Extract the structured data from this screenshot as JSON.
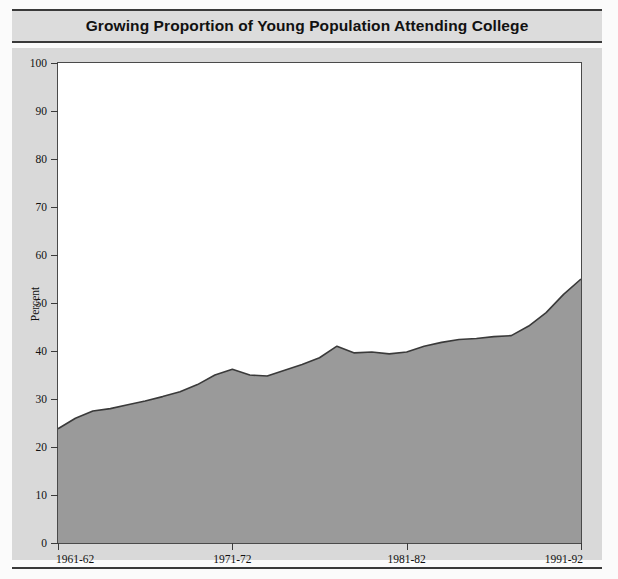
{
  "title": "Growing Proportion of Young Population Attending College",
  "colors": {
    "area_fill": "#9a9a9a",
    "area_line": "#3a3a3a",
    "panel_background": "#d9d9d9",
    "plot_background": "#ffffff",
    "title_band": "#dcdcdc",
    "rule": "#3a3a3a",
    "text": "#111111"
  },
  "axes": {
    "ylabel": "Percent",
    "yticks": [
      "100",
      "90",
      "80",
      "70",
      "60",
      "50",
      "40",
      "30",
      "20",
      "10",
      "0"
    ],
    "xticks": [
      "1961-62",
      "1971-72",
      "1981-82",
      "1991-92"
    ]
  },
  "chart_data": {
    "type": "area",
    "title": "Growing Proportion of Young Population Attending College",
    "xlabel": "",
    "ylabel": "Percent",
    "ylim": [
      0,
      100
    ],
    "grid": false,
    "legend": "none",
    "categories": [
      "1961-62",
      "1962-63",
      "1963-64",
      "1964-65",
      "1965-66",
      "1966-67",
      "1967-68",
      "1968-69",
      "1969-70",
      "1970-71",
      "1971-72",
      "1972-73",
      "1973-74",
      "1974-75",
      "1975-76",
      "1976-77",
      "1977-78",
      "1978-79",
      "1979-80",
      "1980-81",
      "1981-82",
      "1982-83",
      "1983-84",
      "1984-85",
      "1985-86",
      "1986-87",
      "1987-88",
      "1988-89",
      "1989-90",
      "1990-91",
      "1991-92"
    ],
    "values": [
      23.8,
      26.0,
      27.5,
      28.0,
      28.8,
      29.6,
      30.5,
      31.5,
      33.0,
      35.0,
      36.2,
      35.0,
      34.8,
      36.0,
      37.2,
      38.6,
      41.0,
      39.6,
      39.8,
      39.4,
      39.8,
      41.0,
      41.8,
      42.4,
      42.6,
      43.0,
      43.2,
      45.2,
      48.0,
      51.8,
      55.0
    ],
    "xlim": [
      "1961-62",
      "1991-92"
    ],
    "tick_labels_shown": [
      "1961-62",
      "1971-72",
      "1981-82",
      "1991-92"
    ]
  }
}
